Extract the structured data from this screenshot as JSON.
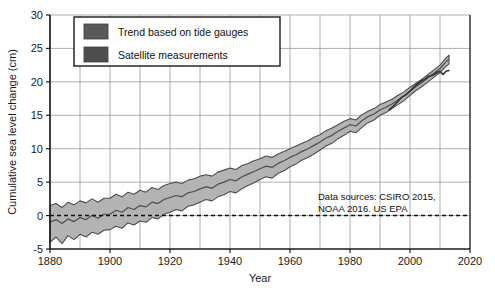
{
  "chart_data": {
    "type": "area",
    "title": "",
    "xlabel": "Year",
    "ylabel": "Cumulative sea level change (cm)",
    "xlim": [
      1880,
      2020
    ],
    "ylim": [
      -5,
      30
    ],
    "x_ticks": [
      1880,
      1900,
      1920,
      1940,
      1960,
      1980,
      2000,
      2020
    ],
    "y_ticks": [
      -5,
      0,
      5,
      10,
      15,
      20,
      25,
      30
    ],
    "x_minor_step": 10,
    "grid": true,
    "legend_position": "top-left",
    "zero_reference_line": 0,
    "legend": [
      {
        "name": "Trend based on tide gauges",
        "color": "#595959"
      },
      {
        "name": "Satellite measurements",
        "color": "#4d4d4d"
      }
    ],
    "annotation": {
      "line1": "Data sources: CSIRO 2015,",
      "line2": "NOAA 2016. US EPA"
    },
    "series": [
      {
        "name": "Trend based on tide gauges",
        "kind": "band",
        "x": [
          1880,
          1882,
          1884,
          1886,
          1888,
          1890,
          1892,
          1894,
          1896,
          1898,
          1900,
          1902,
          1904,
          1906,
          1908,
          1910,
          1912,
          1914,
          1916,
          1918,
          1920,
          1922,
          1924,
          1926,
          1928,
          1930,
          1932,
          1934,
          1936,
          1938,
          1940,
          1942,
          1944,
          1946,
          1948,
          1950,
          1952,
          1954,
          1956,
          1958,
          1960,
          1962,
          1964,
          1966,
          1968,
          1970,
          1972,
          1974,
          1976,
          1978,
          1980,
          1982,
          1984,
          1986,
          1988,
          1990,
          1992,
          1994,
          1996,
          1998,
          2000,
          2002,
          2004,
          2006,
          2008,
          2010,
          2012,
          2013
        ],
        "center": [
          -1.0,
          -0.6,
          -1.2,
          -0.5,
          -0.9,
          -0.3,
          -0.6,
          0.0,
          -0.4,
          0.2,
          0.2,
          0.8,
          0.5,
          1.2,
          0.9,
          1.5,
          1.3,
          2.0,
          1.8,
          2.4,
          2.7,
          3.0,
          2.8,
          3.4,
          3.6,
          4.0,
          4.3,
          4.1,
          4.7,
          5.0,
          5.4,
          5.2,
          5.8,
          6.2,
          6.6,
          7.0,
          7.4,
          7.2,
          7.8,
          8.2,
          8.7,
          9.1,
          9.6,
          10.0,
          10.5,
          11.0,
          11.6,
          12.0,
          12.6,
          13.1,
          13.6,
          13.4,
          14.2,
          14.8,
          15.2,
          15.8,
          16.2,
          16.7,
          17.3,
          17.9,
          18.6,
          19.3,
          19.9,
          20.6,
          21.3,
          22.0,
          23.0,
          23.4
        ],
        "upper": [
          1.5,
          1.8,
          1.2,
          2.0,
          1.6,
          2.2,
          1.9,
          2.5,
          2.0,
          2.6,
          2.6,
          3.2,
          2.8,
          3.5,
          3.2,
          3.8,
          3.5,
          4.2,
          3.9,
          4.5,
          4.8,
          5.0,
          4.8,
          5.3,
          5.5,
          5.9,
          6.1,
          5.9,
          6.5,
          6.8,
          7.1,
          6.9,
          7.5,
          7.8,
          8.2,
          8.5,
          8.9,
          8.7,
          9.2,
          9.6,
          10.0,
          10.4,
          10.8,
          11.2,
          11.7,
          12.1,
          12.7,
          13.1,
          13.6,
          14.1,
          14.5,
          14.3,
          15.1,
          15.6,
          16.0,
          16.6,
          17.0,
          17.4,
          18.0,
          18.5,
          19.2,
          19.8,
          20.4,
          21.1,
          21.8,
          22.5,
          23.6,
          24.0
        ],
        "lower": [
          -4.0,
          -3.2,
          -4.2,
          -3.0,
          -3.6,
          -2.8,
          -3.2,
          -2.5,
          -2.8,
          -2.2,
          -2.1,
          -1.6,
          -1.9,
          -1.1,
          -1.4,
          -0.8,
          -1.0,
          -0.3,
          -0.5,
          0.2,
          0.5,
          0.9,
          0.7,
          1.4,
          1.6,
          2.0,
          2.4,
          2.2,
          2.8,
          3.1,
          3.6,
          3.4,
          4.0,
          4.5,
          4.9,
          5.4,
          5.8,
          5.6,
          6.3,
          6.7,
          7.3,
          7.7,
          8.3,
          8.7,
          9.2,
          9.8,
          10.4,
          10.8,
          11.5,
          12.0,
          12.6,
          12.4,
          13.2,
          13.9,
          14.3,
          15.0,
          15.4,
          16.0,
          16.6,
          17.2,
          18.0,
          18.7,
          19.3,
          20.0,
          20.7,
          21.4,
          22.3,
          22.7
        ]
      },
      {
        "name": "Satellite measurements",
        "kind": "line",
        "x": [
          1993,
          1994,
          1995,
          1996,
          1997,
          1998,
          1999,
          2000,
          2001,
          2002,
          2003,
          2004,
          2005,
          2006,
          2007,
          2008,
          2009,
          2010,
          2011,
          2012,
          2013
        ],
        "y": [
          15.8,
          16.2,
          16.6,
          17.1,
          17.6,
          17.9,
          18.2,
          18.6,
          19.1,
          19.5,
          19.9,
          20.2,
          20.4,
          20.8,
          20.9,
          21.1,
          21.4,
          21.6,
          21.1,
          21.6,
          21.7
        ]
      }
    ]
  }
}
